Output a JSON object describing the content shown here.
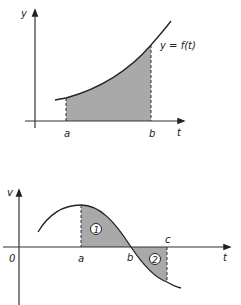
{
  "top_graph": {
    "y_axis_label": "y",
    "x_axis_label": "t",
    "function_label": "y = f(t)",
    "bound_a": "a",
    "bound_b": "b",
    "shading_color": "#a9a9a9"
  },
  "bottom_graph": {
    "y_axis_label": "v",
    "x_axis_label": "t",
    "origin_label": "0",
    "bound_a": "a",
    "bound_b": "b",
    "bound_c": "c",
    "region_1_label": "1",
    "region_2_label": "2",
    "shading_color": "#a9a9a9"
  }
}
